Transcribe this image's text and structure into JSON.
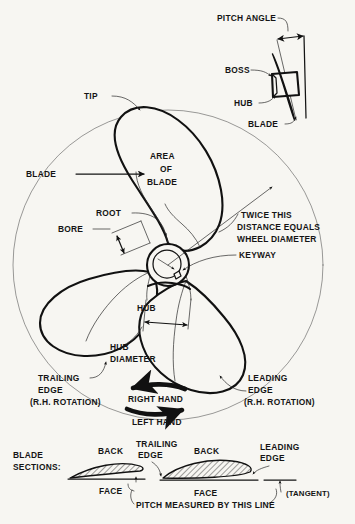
{
  "figure": {
    "background_color": "#f7f6f2",
    "ink_color": "#111111"
  },
  "inset": {
    "name": "pitch angle detail",
    "labels": {
      "pitch_angle": "PITCH ANGLE",
      "boss": "BOSS",
      "hub": "HUB",
      "blade": "BLADE"
    }
  },
  "main_view": {
    "name": "three blade propeller front view",
    "labels": {
      "tip": "TIP",
      "blade": "BLADE",
      "area_of_blade_line1": "AREA",
      "area_of_blade_line2": "OF",
      "area_of_blade_line3": "BLADE",
      "root": "ROOT",
      "bore": "BORE",
      "keyway": "KEYWAY",
      "hub": "HUB",
      "hub_diameter_line1": "HUB",
      "hub_diameter_line2": "DIAMETER",
      "radius_note_line1": "TWICE THIS",
      "radius_note_line2": "DISTANCE EQUALS",
      "radius_note_line3": "WHEEL DIAMETER",
      "trailing_edge_line1": "TRAILING",
      "trailing_edge_line2": "EDGE",
      "trailing_edge_line3": "(R.H. ROTATION)",
      "leading_edge_line1": "LEADING",
      "leading_edge_line2": "EDGE",
      "leading_edge_line3": "(R.H. ROTATION)"
    }
  },
  "rotation": {
    "right_hand": "RIGHT HAND",
    "left_hand": "LEFT HAND"
  },
  "blade_sections": {
    "title_line1": "BLADE",
    "title_line2": "SECTIONS:",
    "left_section": {
      "back": "BACK",
      "face": "FACE"
    },
    "right_section": {
      "back": "BACK",
      "face": "FACE"
    },
    "trailing_edge_line1": "TRAILING",
    "trailing_edge_line2": "EDGE",
    "leading_edge_line1": "LEADING",
    "leading_edge_line2": "EDGE",
    "tangent": "(TANGENT)",
    "pitch_line_note": "PITCH MEASURED BY THIS LINE"
  }
}
